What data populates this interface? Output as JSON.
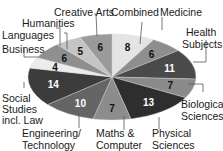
{
  "chart_data": {
    "type": "pie",
    "title": "",
    "start": "top, clockwise",
    "slices": [
      {
        "label": "Combined",
        "value": 8,
        "color": "#e4e4e4",
        "text_color": "#111111"
      },
      {
        "label": "Medicine",
        "value": 6,
        "color": "#8e8e8e",
        "text_color": "#111111"
      },
      {
        "label": "Health Subjects",
        "value": 11,
        "color": "#4a4a4a",
        "text_color": "#ffffff"
      },
      {
        "label": "Biological Sciences",
        "value": 7,
        "color": "#8a8a8a",
        "text_color": "#111111"
      },
      {
        "label": "Physical Sciences",
        "value": 13,
        "color": "#2e2e2e",
        "text_color": "#ffffff"
      },
      {
        "label": "Maths & Computer",
        "value": 7,
        "color": "#8c8c8c",
        "text_color": "#111111"
      },
      {
        "label": "Engineering/ Technology",
        "value": 10,
        "color": "#656565",
        "text_color": "#ffffff"
      },
      {
        "label": "Social Studies incl. Law",
        "value": 14,
        "color": "#3c3c3c",
        "text_color": "#ffffff"
      },
      {
        "label": "Business",
        "value": 4,
        "color": "#ececec",
        "text_color": "#111111"
      },
      {
        "label": "Languages",
        "value": 6,
        "color": "#8f8f8f",
        "text_color": "#111111"
      },
      {
        "label": "Humanities",
        "value": 5,
        "color": "#c4c4c4",
        "text_color": "#111111"
      },
      {
        "label": "Creative Arts",
        "value": 6,
        "color": "#9a9a9a",
        "text_color": "#111111"
      }
    ],
    "legend": "none (callout labels)"
  },
  "labels": {
    "combined": "Combined",
    "medicine": "Medicine",
    "health_1": "Health",
    "health_2": "Subjects",
    "bio_1": "Biological",
    "bio_2": "Sciences",
    "phys_1": "Physical",
    "phys_2": "Sciences",
    "maths_1": "Maths &",
    "maths_2": "Computer",
    "eng_1": "Engineering/",
    "eng_2": "Technology",
    "social_1": "Social",
    "social_2": "Studies",
    "social_3": "incl. Law",
    "business": "Business",
    "languages": "Languages",
    "humanities": "Humanities",
    "creative": "Creative Arts"
  }
}
